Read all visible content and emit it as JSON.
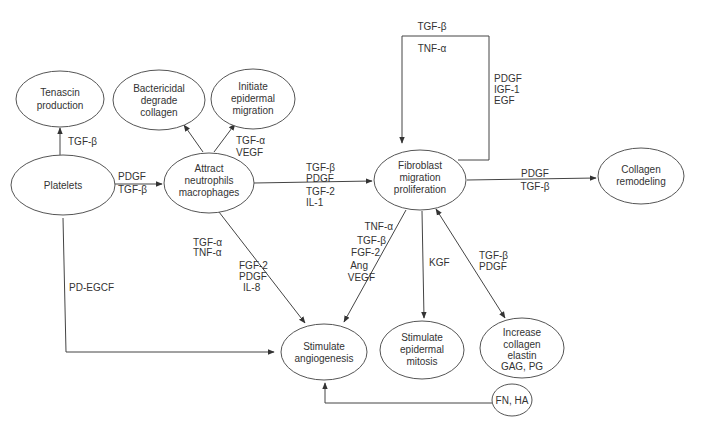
{
  "colors": {
    "stroke": "#555555",
    "text": "#333333",
    "background": "#ffffff"
  },
  "nodes": {
    "tenascin": {
      "lines": [
        "Tenascin",
        "production"
      ]
    },
    "platelets": {
      "lines": [
        "Platelets"
      ]
    },
    "bactericidal": {
      "lines": [
        "Bactericidal",
        "degrade",
        "collagen"
      ]
    },
    "initiate": {
      "lines": [
        "Initiate",
        "epidermal",
        "migration"
      ]
    },
    "attract": {
      "lines": [
        "Attract",
        "neutrophils",
        "macrophages"
      ]
    },
    "fibroblast": {
      "lines": [
        "Fibroblast",
        "migration",
        "proliferation"
      ]
    },
    "collagen_remodeling": {
      "lines": [
        "Collagen",
        "remodeling"
      ]
    },
    "angiogenesis": {
      "lines": [
        "Stimulate",
        "angiogenesis"
      ]
    },
    "epidermal_mitosis": {
      "lines": [
        "Stimulate",
        "epidermal",
        "mitosis"
      ]
    },
    "increase_collagen": {
      "lines": [
        "Increase",
        "collagen",
        "elastin",
        "GAG, PG"
      ]
    },
    "fn_ha": {
      "lines": [
        "FN, HA"
      ]
    }
  },
  "edge_labels": {
    "platelets_tenascin": [
      "TGF-β"
    ],
    "platelets_attract": [
      "PDGF",
      "TGF-β"
    ],
    "attract_initiate": [
      "TGF-α",
      "VEGF"
    ],
    "attract_fibroblast": [
      "TGF-β",
      "PDGF",
      "TGF-2",
      "IL-1"
    ],
    "fibroblast_loop_top": [
      "TGF-β",
      "TNF-α"
    ],
    "fibroblast_loop_side": [
      "PDGF",
      "IGF-1",
      "EGF"
    ],
    "fibroblast_collagen": [
      "PDGF",
      "TGF-β"
    ],
    "attract_angiogenesis_a": [
      "TGF-α",
      "TNF-α"
    ],
    "attract_angiogenesis_b": [
      "FGF-2",
      "PDGF",
      "IL-8"
    ],
    "fibroblast_angiogenesis": [
      "TNF-α",
      "TGF-β",
      "FGF-2",
      "Ang",
      "VEGF"
    ],
    "fibroblast_mitosis": [
      "KGF"
    ],
    "fibroblast_increase": [
      "TGF-β",
      "PDGF"
    ],
    "platelets_angiogenesis": [
      "PD-EGCF"
    ]
  }
}
